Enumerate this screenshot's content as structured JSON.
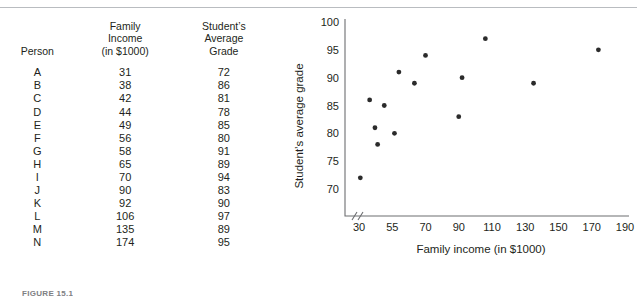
{
  "figure": {
    "caption": "FIGURE 15.1",
    "top_rule": true
  },
  "table": {
    "headers": [
      {
        "lines": [
          "Person"
        ]
      },
      {
        "lines": [
          "Family",
          "Income",
          "(in $1000)"
        ]
      },
      {
        "lines": [
          "Student’s",
          "Average",
          "Grade"
        ]
      }
    ],
    "rows": [
      {
        "person": "A",
        "income": "31",
        "grade": "72"
      },
      {
        "person": "B",
        "income": "38",
        "grade": "86"
      },
      {
        "person": "C",
        "income": "42",
        "grade": "81"
      },
      {
        "person": "D",
        "income": "44",
        "grade": "78"
      },
      {
        "person": "E",
        "income": "49",
        "grade": "85"
      },
      {
        "person": "F",
        "income": "56",
        "grade": "80"
      },
      {
        "person": "G",
        "income": "58",
        "grade": "91"
      },
      {
        "person": "H",
        "income": "65",
        "grade": "89"
      },
      {
        "person": "I",
        "income": "70",
        "grade": "94"
      },
      {
        "person": "J",
        "income": "90",
        "grade": "83"
      },
      {
        "person": "K",
        "income": "92",
        "grade": "90"
      },
      {
        "person": "L",
        "income": "106",
        "grade": "97"
      },
      {
        "person": "M",
        "income": "135",
        "grade": "89"
      },
      {
        "person": "N",
        "income": "174",
        "grade": "95"
      }
    ]
  },
  "chart_data": {
    "type": "scatter",
    "title": "",
    "xlabel": "Family income (in $1000)",
    "ylabel": "Student’s average grade",
    "xticks": [
      30,
      55,
      70,
      90,
      110,
      130,
      150,
      170,
      190
    ],
    "yticks": [
      70,
      75,
      80,
      85,
      90,
      95,
      100
    ],
    "xlim": [
      20,
      200
    ],
    "ylim": [
      68,
      100
    ],
    "grid": false,
    "legend": null,
    "axis_break": "x-axis break near origin",
    "point_color": "#2b2b2b",
    "points": [
      {
        "label": "A",
        "x": 31,
        "y": 72
      },
      {
        "label": "B",
        "x": 38,
        "y": 86
      },
      {
        "label": "C",
        "x": 42,
        "y": 81
      },
      {
        "label": "D",
        "x": 44,
        "y": 78
      },
      {
        "label": "E",
        "x": 49,
        "y": 85
      },
      {
        "label": "F",
        "x": 56,
        "y": 80
      },
      {
        "label": "G",
        "x": 58,
        "y": 91
      },
      {
        "label": "H",
        "x": 65,
        "y": 89
      },
      {
        "label": "I",
        "x": 70,
        "y": 94
      },
      {
        "label": "J",
        "x": 90,
        "y": 83
      },
      {
        "label": "K",
        "x": 92,
        "y": 90
      },
      {
        "label": "L",
        "x": 106,
        "y": 97
      },
      {
        "label": "M",
        "x": 135,
        "y": 89
      },
      {
        "label": "N",
        "x": 174,
        "y": 95
      }
    ]
  }
}
